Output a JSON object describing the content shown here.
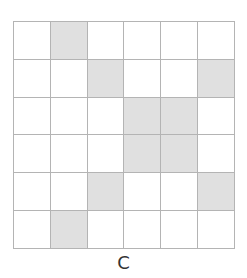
{
  "figure": {
    "label": "C",
    "rows": 6,
    "cols": 6,
    "colors": {
      "shaded": "#e0e0e0",
      "empty": "#ffffff",
      "grid_line": "#b4b4b4"
    },
    "cells": [
      [
        0,
        1,
        0,
        0,
        0,
        0
      ],
      [
        0,
        0,
        1,
        0,
        0,
        1
      ],
      [
        0,
        0,
        0,
        1,
        1,
        0
      ],
      [
        0,
        0,
        0,
        1,
        1,
        0
      ],
      [
        0,
        0,
        1,
        0,
        0,
        1
      ],
      [
        0,
        1,
        0,
        0,
        0,
        0
      ]
    ]
  }
}
